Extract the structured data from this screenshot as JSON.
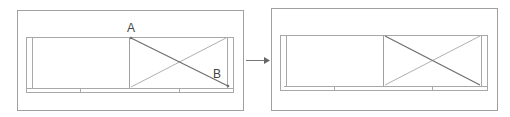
{
  "diagram": {
    "type": "before-after",
    "before": {
      "labels": {
        "a": "A",
        "b": "B"
      },
      "description": "Window frame with two panes; right pane has diagonal drawn from point A (top-left) to point B (bottom-right)"
    },
    "after": {
      "description": "Same window frame; right pane shows an X cross with highlighted diagonal"
    },
    "colors": {
      "frame": "#9a9a9a",
      "outer": "#a0a0a0",
      "highlight_line": "#707070",
      "arrow": "#666666"
    }
  }
}
